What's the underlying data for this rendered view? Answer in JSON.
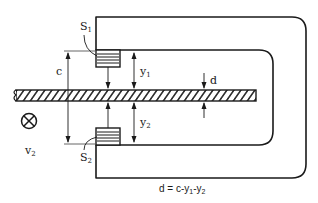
{
  "diagram": {
    "labels": {
      "s1": {
        "main": "S",
        "sub": "1"
      },
      "s2": {
        "main": "S",
        "sub": "2"
      },
      "c": "c",
      "y1": {
        "main": "y",
        "sub": "1"
      },
      "y2": {
        "main": "y",
        "sub": "2"
      },
      "d": "d",
      "v2": {
        "main": "v",
        "sub": "2"
      },
      "formula": {
        "lhs": "d = c-y",
        "sub1": "1",
        "mid": "-y",
        "sub2": "2"
      }
    },
    "symbols": {
      "motion_direction": "cross-in-circle-icon"
    },
    "colors": {
      "stroke": "#1a1a1a",
      "dim_line": "#555555",
      "background": "#ffffff"
    }
  }
}
